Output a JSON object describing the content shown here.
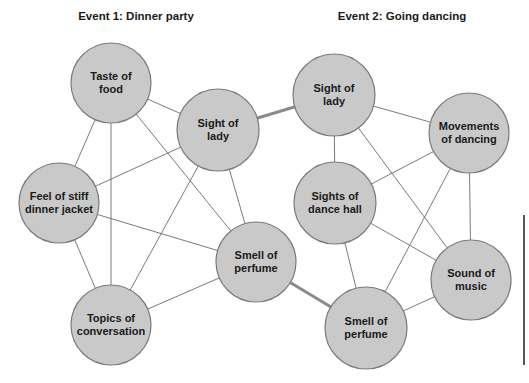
{
  "colors": {
    "node_fill": "#c9c9c9",
    "node_stroke": "#7a7a7a",
    "edge": "#6b6b6b",
    "bridge_edge": "#8a8a8a",
    "text": "#1a1a1a"
  },
  "events": [
    {
      "title": "Event 1: Dinner party",
      "title_pos": [
        136,
        17
      ],
      "nodes": [
        {
          "id": "taste_food",
          "label": "Taste of\nfood",
          "cx": 111,
          "cy": 83,
          "r": 40
        },
        {
          "id": "sight_lady_1",
          "label": "Sight of\nlady",
          "cx": 218,
          "cy": 130,
          "r": 41
        },
        {
          "id": "feel_jacket",
          "label": "Feel of stiff\ndinner jacket",
          "cx": 59,
          "cy": 203,
          "r": 40
        },
        {
          "id": "smell_perfume_1",
          "label": "Smell of\nperfume",
          "cx": 256,
          "cy": 262,
          "r": 40
        },
        {
          "id": "topics_conversation",
          "label": "Topics of\nconversation",
          "cx": 111,
          "cy": 325,
          "r": 40
        }
      ],
      "edges": [
        [
          "taste_food",
          "sight_lady_1"
        ],
        [
          "taste_food",
          "feel_jacket"
        ],
        [
          "taste_food",
          "topics_conversation"
        ],
        [
          "taste_food",
          "smell_perfume_1"
        ],
        [
          "sight_lady_1",
          "feel_jacket"
        ],
        [
          "sight_lady_1",
          "smell_perfume_1"
        ],
        [
          "sight_lady_1",
          "topics_conversation"
        ],
        [
          "feel_jacket",
          "smell_perfume_1"
        ],
        [
          "feel_jacket",
          "topics_conversation"
        ],
        [
          "smell_perfume_1",
          "topics_conversation"
        ]
      ]
    },
    {
      "title": "Event 2: Going dancing",
      "title_pos": [
        402,
        17
      ],
      "nodes": [
        {
          "id": "sight_lady_2",
          "label": "Sight of\nlady",
          "cx": 334,
          "cy": 95,
          "r": 41
        },
        {
          "id": "movements_dancing",
          "label": "Movements\nof dancing",
          "cx": 469,
          "cy": 133,
          "r": 40
        },
        {
          "id": "sights_dance_hall",
          "label": "Sights of\ndance hall",
          "cx": 335,
          "cy": 203,
          "r": 41
        },
        {
          "id": "sound_music",
          "label": "Sound of\nmusic",
          "cx": 471,
          "cy": 280,
          "r": 40
        },
        {
          "id": "smell_perfume_2",
          "label": "Smell of\nperfume",
          "cx": 366,
          "cy": 328,
          "r": 41
        }
      ],
      "edges": [
        [
          "sight_lady_2",
          "movements_dancing"
        ],
        [
          "sight_lady_2",
          "sights_dance_hall"
        ],
        [
          "sight_lady_2",
          "sound_music"
        ],
        [
          "movements_dancing",
          "sights_dance_hall"
        ],
        [
          "movements_dancing",
          "sound_music"
        ],
        [
          "movements_dancing",
          "smell_perfume_2"
        ],
        [
          "sights_dance_hall",
          "sound_music"
        ],
        [
          "sights_dance_hall",
          "smell_perfume_2"
        ],
        [
          "sound_music",
          "smell_perfume_2"
        ]
      ]
    }
  ],
  "bridges": [
    [
      "sight_lady_1",
      "sight_lady_2"
    ],
    [
      "smell_perfume_1",
      "smell_perfume_2"
    ]
  ],
  "margin_rule": {
    "x": 524,
    "y1": 215,
    "y2": 365
  }
}
